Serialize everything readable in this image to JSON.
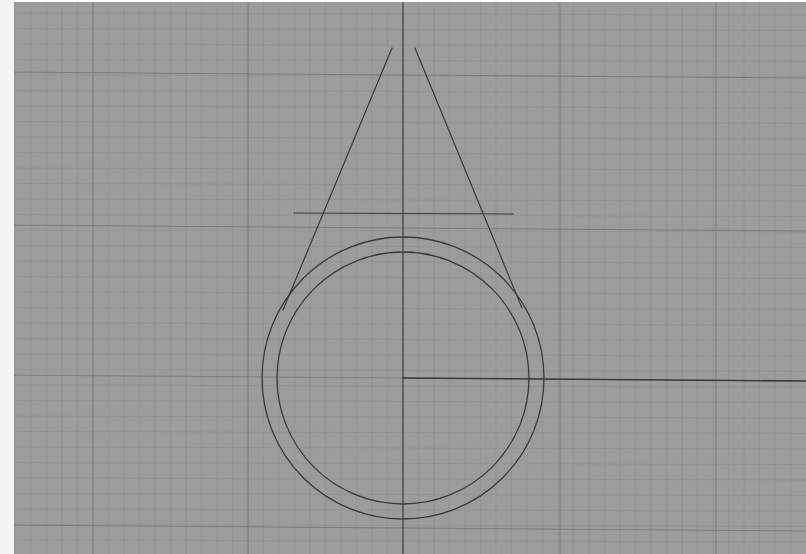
{
  "viewport": {
    "background": "#9c9c9c",
    "left_margin_color": "#f4f4f4",
    "grid": {
      "minor_color": "#8f8f8f",
      "major_color": "#7c7c7c",
      "minor_spacing": 15.5,
      "major_x": [
        93,
        248,
        403,
        560,
        716
      ],
      "major_y": [
        75,
        228,
        378,
        528
      ]
    },
    "drawing": {
      "stroke_color": "#3a3a3a",
      "vertical_axis": {
        "x": 403,
        "y1": 0,
        "y2": 554
      },
      "horizontal_axis": {
        "x1": 403,
        "y1": 378,
        "x2": 806,
        "y2": 381
      },
      "circle_outer": {
        "cx": 403,
        "cy": 378,
        "r": 141
      },
      "circle_inner": {
        "cx": 403,
        "cy": 378,
        "r": 126
      },
      "apex": {
        "x": 405,
        "y": 65
      },
      "tangent_left": {
        "x1": 392,
        "y1": 48,
        "x2": 283,
        "y2": 310
      },
      "tangent_right": {
        "x1": 415,
        "y1": 48,
        "x2": 522,
        "y2": 308
      },
      "horizontal_line": {
        "x1": 294,
        "y1": 213,
        "x2": 513,
        "y2": 214
      }
    }
  }
}
